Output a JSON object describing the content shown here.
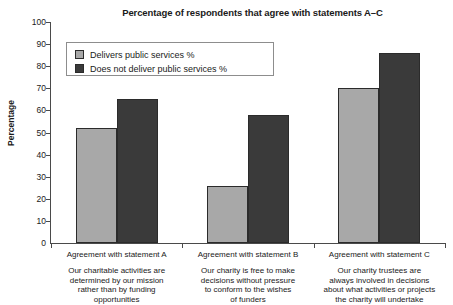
{
  "chart_data": {
    "type": "bar",
    "title": "Percentage of respondents that agree with statements A–C",
    "xlabel": "",
    "ylabel": "Percentage",
    "ylim": [
      0,
      100
    ],
    "ytick_step": 10,
    "yticks": [
      0,
      10,
      20,
      30,
      40,
      50,
      60,
      70,
      80,
      90,
      100
    ],
    "grid": false,
    "legend_position": "upper-left-inside",
    "categories": [
      "Agreement with statement A",
      "Agreement with statement B",
      "Agreement with statement C"
    ],
    "category_descriptions": [
      "Our charitable activities are determined by our mission rather than by funding opportunities",
      "Our charity is free to make decisions without pressure to conform to the wishes of funders",
      "Our charity trustees are always involved in decisions about what activities or projects the charity will undertake"
    ],
    "series": [
      {
        "name": "Delivers public services %",
        "color": "#a8a8a8",
        "values": [
          52,
          26,
          70
        ]
      },
      {
        "name": "Does not deliver public services %",
        "color": "#3a3a3a",
        "values": [
          65,
          58,
          86
        ]
      }
    ]
  },
  "axis": {
    "tick_labels": [
      "100",
      "90",
      "80",
      "70",
      "60",
      "50",
      "40",
      "30",
      "20",
      "10",
      "0"
    ]
  },
  "categories_display": [
    {
      "name": "Agreement with statement A",
      "desc_lines": [
        "Our charitable activities are",
        "determined by our mission",
        "rather than by funding",
        "opportunities"
      ]
    },
    {
      "name": "Agreement with statement B",
      "desc_lines": [
        "Our charity is free to make",
        "decisions without pressure",
        "to conform to the wishes",
        "of funders"
      ]
    },
    {
      "name": "Agreement with statement C",
      "desc_lines": [
        "Our charity trustees are",
        "always involved in decisions",
        "about what activities or projects",
        "the charity will undertake"
      ]
    }
  ]
}
